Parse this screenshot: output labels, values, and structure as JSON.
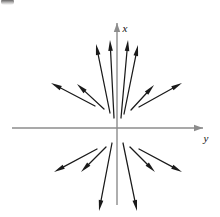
{
  "figure": {
    "title": "",
    "caption": "",
    "background_color": "#ffffff",
    "width": 220,
    "height": 217
  },
  "axes": {
    "origin": {
      "x": 117,
      "y": 128
    },
    "color": "#8c8c8c",
    "stroke_width": 1.4,
    "vertical": {
      "label": "x",
      "label_position": {
        "x": 125,
        "y": 29
      },
      "from": {
        "x": 117,
        "y": 205
      },
      "to": {
        "x": 117,
        "y": 23
      },
      "arrow_at": "top"
    },
    "horizontal": {
      "label": "y",
      "label_position": {
        "x": 206,
        "y": 139
      },
      "from": {
        "x": 12,
        "y": 128
      },
      "to": {
        "x": 203,
        "y": 128
      },
      "arrow_at": "right"
    }
  },
  "chart_data": {
    "type": "scatter",
    "title": "",
    "subtitle": "",
    "xlabel": "y",
    "ylabel": "x",
    "xlim": [
      -105,
      86
    ],
    "ylim": [
      -77,
      105
    ],
    "grid": false,
    "legend": null,
    "annotations": [],
    "vector_field": {
      "arrow_color": "#1a1a1a",
      "arrow_stroke_width": 1.25,
      "arrow_head_length": 11,
      "arrow_head_width": 4.6,
      "direction": "outward-from-origin",
      "count": 12,
      "arrows": [
        {
          "id": "q2-outer",
          "quadrant": 2,
          "tail": {
            "x": 95,
            "y": 106
          },
          "tip": {
            "x": 51,
            "y": 83
          }
        },
        {
          "id": "q2-mid",
          "quadrant": 2,
          "tail": {
            "x": 104,
            "y": 109
          },
          "tip": {
            "x": 77,
            "y": 84
          }
        },
        {
          "id": "q2-inner",
          "quadrant": 2,
          "tail": {
            "x": 110,
            "y": 113
          },
          "tip": {
            "x": 96,
            "y": 44
          }
        },
        {
          "id": "q2-axis",
          "quadrant": 2,
          "tail": {
            "x": 114,
            "y": 118
          },
          "tip": {
            "x": 110,
            "y": 40
          }
        },
        {
          "id": "q1-axis",
          "quadrant": 1,
          "tail": {
            "x": 121,
            "y": 118
          },
          "tip": {
            "x": 128,
            "y": 40
          }
        },
        {
          "id": "q1-inner",
          "quadrant": 1,
          "tail": {
            "x": 124,
            "y": 114
          },
          "tip": {
            "x": 138,
            "y": 45
          }
        },
        {
          "id": "q1-mid",
          "quadrant": 1,
          "tail": {
            "x": 131,
            "y": 110
          },
          "tip": {
            "x": 154,
            "y": 85
          }
        },
        {
          "id": "q1-outer",
          "quadrant": 1,
          "tail": {
            "x": 139,
            "y": 107
          },
          "tip": {
            "x": 182,
            "y": 83
          }
        },
        {
          "id": "q3-outer",
          "quadrant": 3,
          "tail": {
            "x": 97,
            "y": 149
          },
          "tip": {
            "x": 54,
            "y": 172
          }
        },
        {
          "id": "q3-mid",
          "quadrant": 3,
          "tail": {
            "x": 106,
            "y": 147
          },
          "tip": {
            "x": 81,
            "y": 172
          }
        },
        {
          "id": "q3-inner",
          "quadrant": 3,
          "tail": {
            "x": 112,
            "y": 143
          },
          "tip": {
            "x": 99,
            "y": 211
          }
        },
        {
          "id": "q4-inner",
          "quadrant": 4,
          "tail": {
            "x": 123,
            "y": 143
          },
          "tip": {
            "x": 137,
            "y": 211
          }
        },
        {
          "id": "q4-mid",
          "quadrant": 4,
          "tail": {
            "x": 130,
            "y": 147
          },
          "tip": {
            "x": 155,
            "y": 172
          }
        },
        {
          "id": "q4-outer",
          "quadrant": 4,
          "tail": {
            "x": 139,
            "y": 149
          },
          "tip": {
            "x": 182,
            "y": 172
          }
        }
      ]
    }
  }
}
